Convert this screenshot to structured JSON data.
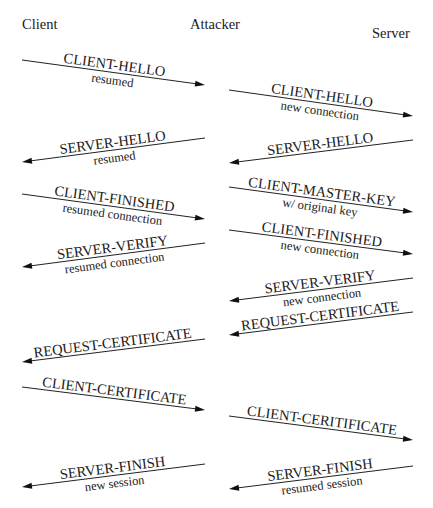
{
  "diagram": {
    "parties": [
      {
        "id": "client",
        "label": "Client",
        "x": 22,
        "y": 29
      },
      {
        "id": "attacker",
        "label": "Attacker",
        "x": 190,
        "y": 29
      },
      {
        "id": "server",
        "label": "Server",
        "x": 372,
        "y": 38
      }
    ],
    "messages": [
      {
        "label": "CLIENT-HELLO",
        "sublabel": "resumed",
        "from": "client",
        "to": "attacker",
        "x1": 22,
        "y1": 60,
        "x2": 205,
        "y2": 85
      },
      {
        "label": "CLIENT-HELLO",
        "sublabel": "new connection",
        "from": "attacker",
        "to": "server",
        "x1": 229,
        "y1": 90,
        "x2": 413,
        "y2": 116
      },
      {
        "label": "SERVER-HELLO",
        "sublabel": "resumed",
        "from": "attacker",
        "to": "client",
        "x1": 205,
        "y1": 138,
        "x2": 22,
        "y2": 162
      },
      {
        "label": "SERVER-HELLO",
        "sublabel": "",
        "from": "server",
        "to": "attacker",
        "x1": 413,
        "y1": 140,
        "x2": 229,
        "y2": 163
      },
      {
        "label": "CLIENT-FINISHED",
        "sublabel": "resumed connection",
        "from": "client",
        "to": "attacker",
        "x1": 22,
        "y1": 194,
        "x2": 205,
        "y2": 219
      },
      {
        "label": "CLIENT-MASTER-KEY",
        "sublabel": "w/ original key",
        "from": "attacker",
        "to": "server",
        "x1": 229,
        "y1": 187,
        "x2": 413,
        "y2": 212
      },
      {
        "label": "CLIENT-FINISHED",
        "sublabel": "new connection",
        "from": "attacker",
        "to": "server",
        "x1": 229,
        "y1": 230,
        "x2": 413,
        "y2": 254
      },
      {
        "label": "SERVER-VERIFY",
        "sublabel": "resumed connection",
        "from": "attacker",
        "to": "client",
        "x1": 205,
        "y1": 243,
        "x2": 22,
        "y2": 267
      },
      {
        "label": "SERVER-VERIFY",
        "sublabel": "new connection",
        "from": "server",
        "to": "attacker",
        "x1": 413,
        "y1": 278,
        "x2": 229,
        "y2": 301
      },
      {
        "label": "REQUEST-CERTIFICATE",
        "sublabel": "",
        "from": "server",
        "to": "attacker",
        "x1": 413,
        "y1": 312,
        "x2": 229,
        "y2": 335
      },
      {
        "label": "REQUEST-CERTIFICATE",
        "sublabel": "",
        "from": "attacker",
        "to": "client",
        "x1": 205,
        "y1": 339,
        "x2": 22,
        "y2": 362
      },
      {
        "label": "CLIENT-CERTIFICATE",
        "sublabel": "",
        "from": "client",
        "to": "attacker",
        "x1": 22,
        "y1": 387,
        "x2": 205,
        "y2": 410
      },
      {
        "label": "CLIENT-CERITIFICATE",
        "sublabel": "",
        "from": "attacker",
        "to": "server",
        "x1": 229,
        "y1": 416,
        "x2": 413,
        "y2": 440
      },
      {
        "label": "SERVER-FINISH",
        "sublabel": "new session",
        "from": "attacker",
        "to": "client",
        "x1": 205,
        "y1": 464,
        "x2": 22,
        "y2": 487
      },
      {
        "label": "SERVER-FINISH",
        "sublabel": "resumed session",
        "from": "server",
        "to": "attacker",
        "x1": 413,
        "y1": 466,
        "x2": 229,
        "y2": 489
      }
    ]
  }
}
